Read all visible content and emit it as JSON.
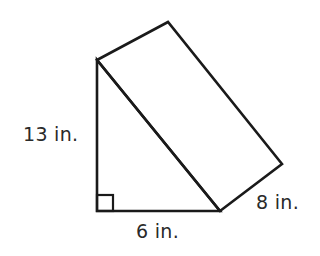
{
  "figure": {
    "type": "triangular-prism",
    "stroke_color": "#1a1a1a",
    "background": "#ffffff",
    "vertices": {
      "triangle_top": [
        97,
        60
      ],
      "triangle_right_angle": [
        97,
        211
      ],
      "triangle_base_end": [
        220,
        211
      ],
      "back_top": [
        168,
        22
      ],
      "back_base_end": [
        282,
        164
      ]
    },
    "right_angle_marker": {
      "x": 97,
      "y": 195,
      "size": 16
    }
  },
  "labels": {
    "height": "13 in.",
    "base": "6 in.",
    "depth": "8 in."
  }
}
